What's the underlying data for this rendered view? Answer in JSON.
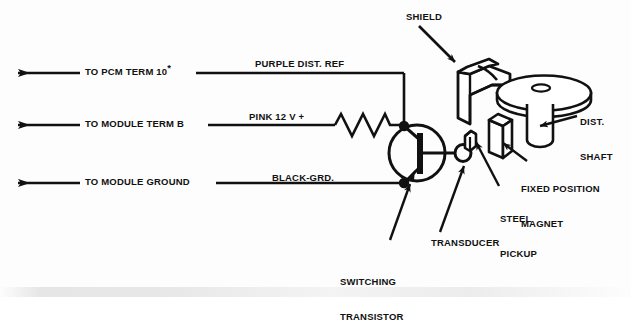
{
  "figure": {
    "kind": "automotive-wiring-schematic",
    "ink_color": "#111111",
    "background_color": "#ffffff"
  },
  "wires": [
    {
      "id": "purple",
      "signal_label": "PURPLE DIST. REF",
      "destination_label": "TO PCM TERM 10",
      "destination_superscript": "*",
      "y": 73
    },
    {
      "id": "pink",
      "signal_label": "PINK 12 V +",
      "destination_label": "TO MODULE TERM B",
      "destination_superscript": "",
      "y": 125
    },
    {
      "id": "black",
      "signal_label": "BLACK-GRD.",
      "destination_label": "TO MODULE GROUND",
      "destination_superscript": "",
      "y": 183
    }
  ],
  "callouts": [
    {
      "id": "shield",
      "label": "SHIELD",
      "lines": [
        "SHIELD"
      ]
    },
    {
      "id": "dist-shaft",
      "label": "DIST. SHAFT",
      "lines": [
        "DIST.",
        "SHAFT"
      ]
    },
    {
      "id": "fixed-magnet",
      "label": "FIXED POSITION MAGNET",
      "lines": [
        "FIXED POSITION",
        "MAGNET"
      ]
    },
    {
      "id": "steel-pickup",
      "label": "STEEL PICKUP",
      "lines": [
        "STEEL",
        "PICKUP"
      ]
    },
    {
      "id": "transducer",
      "label": "TRANSDUCER",
      "lines": [
        "TRANSDUCER"
      ]
    },
    {
      "id": "switching-transistor",
      "label": "SWITCHING TRANSISTOR",
      "lines": [
        "SWITCHING",
        "TRANSISTOR"
      ]
    }
  ],
  "components": {
    "resistor": {
      "name": "resistor",
      "zigzag_peaks": 5
    },
    "transistor": {
      "name": "npn-switching-transistor",
      "symbol": "circle-with-base-bar"
    },
    "junction_dots": 2,
    "distributor": {
      "name": "distributor-disc-and-shaft"
    },
    "transducer": {
      "name": "hall-transducer"
    },
    "steel_pickup": {
      "name": "steel-pickup-block"
    },
    "magnet": {
      "name": "fixed-position-magnet-block"
    }
  }
}
